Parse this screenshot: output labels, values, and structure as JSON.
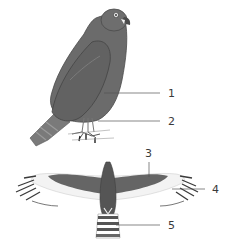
{
  "diagram": {
    "views": [
      "perched side view",
      "flying top view"
    ],
    "colors": {
      "plumage": "#6b6b6b",
      "plumage_dark": "#4f4f4f",
      "wing_edge": "#e6e6e6",
      "leader_line": "#555555",
      "label_text": "#3a3a3a",
      "background": "#ffffff"
    },
    "callouts": [
      {
        "id": "1",
        "label": "1"
      },
      {
        "id": "2",
        "label": "2"
      },
      {
        "id": "3",
        "label": "3"
      },
      {
        "id": "4",
        "label": "4"
      },
      {
        "id": "5",
        "label": "5"
      }
    ]
  }
}
